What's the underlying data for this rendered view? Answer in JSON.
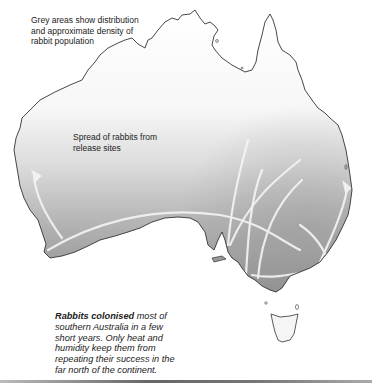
{
  "map": {
    "title": "Spread of rabbits in Australia",
    "legend_text": "Grey areas show distribution and approximate density of rabbit population",
    "arrows_label": "Spread of rabbits from release sites",
    "caption": {
      "bold_lead": "Rabbits colonised",
      "rest": " most of southern Australia in a few short years. Only heat and humidity keep them from repeating their success in the far north of the continent."
    },
    "regions": [
      "Australia mainland",
      "Tasmania"
    ],
    "colors": {
      "coastline": "#333333",
      "dense_grey": "#8a8a8a",
      "light_grey": "#e6e6e6",
      "arrows": "#f2f2f2",
      "background": "#ffffff"
    }
  }
}
